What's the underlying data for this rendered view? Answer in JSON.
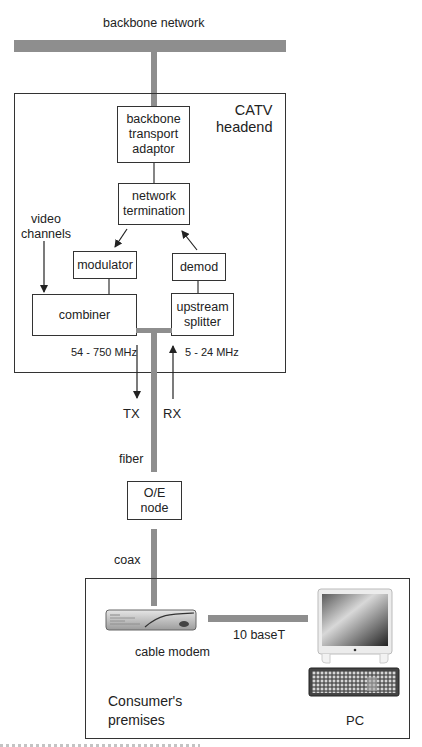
{
  "labels": {
    "backbone_network": "backbone network",
    "headend_title_line1": "CATV",
    "headend_title_line2": "headend",
    "video_channels_line1": "video",
    "video_channels_line2": "channels",
    "downstream_band": "54 - 750 MHz",
    "upstream_band": "5 - 24 MHz",
    "tx": "TX",
    "rx": "RX",
    "fiber": "fiber",
    "coax": "coax",
    "ten_base_t": "10 baseT",
    "cable_modem": "cable modem",
    "premises_line1": "Consumer's",
    "premises_line2": "premises",
    "pc": "PC"
  },
  "blocks": {
    "backbone_transport_adaptor": [
      "backbone",
      "transport",
      "adaptor"
    ],
    "network_termination": [
      "network",
      "termination"
    ],
    "modulator": [
      "modulator"
    ],
    "demod": [
      "demod"
    ],
    "combiner": [
      "combiner"
    ],
    "upstream_splitter": [
      "upstream",
      "splitter"
    ],
    "oe_node": [
      "O/E",
      "node"
    ]
  },
  "icons": {
    "cable_modem": "cable-modem-icon",
    "monitor": "monitor-icon",
    "keyboard": "keyboard-icon"
  },
  "colors": {
    "link_gray": "#8e8e8e",
    "line": "#333333"
  }
}
